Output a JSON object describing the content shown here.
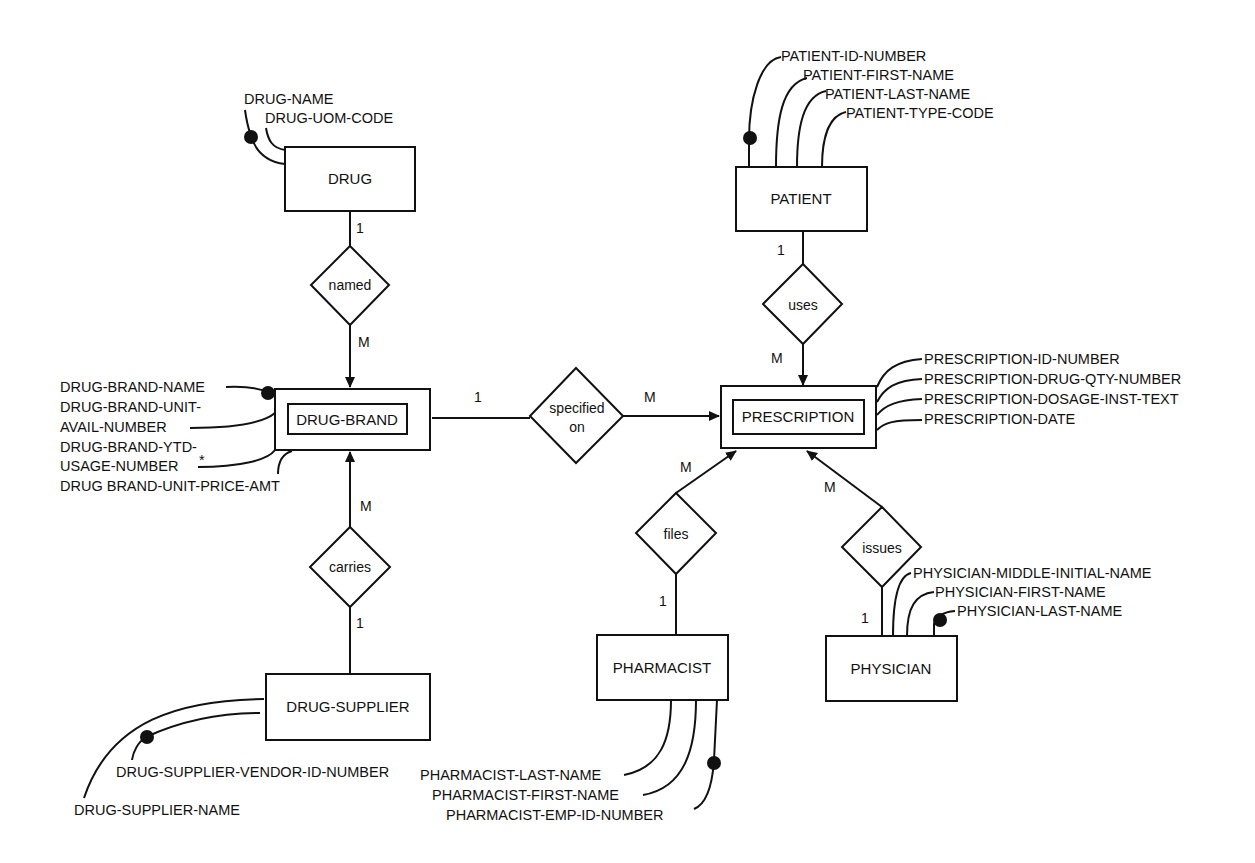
{
  "diagram": {
    "type": "entity-relationship",
    "entities": {
      "drug": {
        "label": "DRUG",
        "attributes": [
          "DRUG-NAME",
          "DRUG-UOM-CODE"
        ],
        "key": "DRUG-NAME"
      },
      "drug_brand": {
        "label": "DRUG-BRAND",
        "weak": true,
        "attributes": [
          "DRUG-BRAND-NAME",
          "DRUG-BRAND-UNIT-",
          "AVAIL-NUMBER",
          "DRUG-BRAND-YTD-",
          "USAGE-NUMBER",
          "DRUG BRAND-UNIT-PRICE-AMT"
        ],
        "key": "DRUG-BRAND-NAME",
        "derived_marker": "*"
      },
      "drug_supplier": {
        "label": "DRUG-SUPPLIER",
        "attributes": [
          "DRUG-SUPPLIER-VENDOR-ID-NUMBER",
          "DRUG-SUPPLIER-NAME"
        ],
        "key": "DRUG-SUPPLIER-VENDOR-ID-NUMBER"
      },
      "patient": {
        "label": "PATIENT",
        "attributes": [
          "PATIENT-ID-NUMBER",
          "PATIENT-FIRST-NAME",
          "PATIENT-LAST-NAME",
          "PATIENT-TYPE-CODE"
        ],
        "key": "PATIENT-ID-NUMBER"
      },
      "prescription": {
        "label": "PRESCRIPTION",
        "weak": true,
        "attributes": [
          "PRESCRIPTION-ID-NUMBER",
          "PRESCRIPTION-DRUG-QTY-NUMBER",
          "PRESCRIPTION-DOSAGE-INST-TEXT",
          "PRESCRIPTION-DATE"
        ]
      },
      "pharmacist": {
        "label": "PHARMACIST",
        "attributes": [
          "PHARMACIST-LAST-NAME",
          "PHARMACIST-FIRST-NAME",
          "PHARMACIST-EMP-ID-NUMBER"
        ],
        "key": "PHARMACIST-EMP-ID-NUMBER"
      },
      "physician": {
        "label": "PHYSICIAN",
        "attributes": [
          "PHYSICIAN-MIDDLE-INITIAL-NAME",
          "PHYSICIAN-FIRST-NAME",
          "PHYSICIAN-LAST-NAME"
        ],
        "key": "PHYSICIAN-LAST-NAME"
      }
    },
    "relationships": {
      "named": {
        "label": "named",
        "from": "DRUG",
        "to": "DRUG-BRAND",
        "from_card": "1",
        "to_card": "M"
      },
      "carries": {
        "label": "carries",
        "from": "DRUG-SUPPLIER",
        "to": "DRUG-BRAND",
        "from_card": "1",
        "to_card": "M"
      },
      "specified_on": {
        "label_line1": "specified",
        "label_line2": "on",
        "from": "DRUG-BRAND",
        "to": "PRESCRIPTION",
        "from_card": "1",
        "to_card": "M"
      },
      "uses": {
        "label": "uses",
        "from": "PATIENT",
        "to": "PRESCRIPTION",
        "from_card": "1",
        "to_card": "M"
      },
      "files": {
        "label": "files",
        "from": "PHARMACIST",
        "to": "PRESCRIPTION",
        "from_card": "1",
        "to_card": "M"
      },
      "issues": {
        "label": "issues",
        "from": "PHYSICIAN",
        "to": "PRESCRIPTION",
        "from_card": "1",
        "to_card": "M"
      }
    }
  }
}
